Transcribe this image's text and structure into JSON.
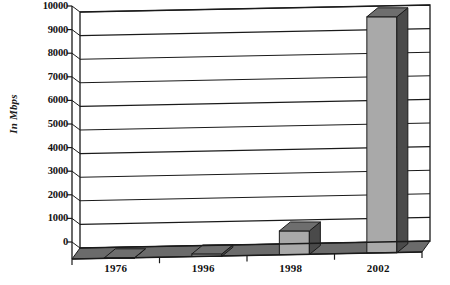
{
  "chart_data": {
    "type": "bar",
    "title": "",
    "subtitle": "",
    "xlabel": "",
    "ylabel": "In Mbps",
    "categories": [
      "1976",
      "1996",
      "1998",
      "2002"
    ],
    "values": [
      10,
      100,
      1000,
      10000
    ],
    "series": [
      {
        "name": "Speed",
        "values": [
          10,
          100,
          1000,
          10000
        ]
      }
    ],
    "ylim": [
      0,
      10000
    ],
    "ytick_labels": [
      "10000",
      "9000",
      "8000",
      "7000",
      "6000",
      "5000",
      "4000",
      "3000",
      "2000",
      "1000",
      "0"
    ],
    "ytick_values": [
      10000,
      9000,
      8000,
      7000,
      6000,
      5000,
      4000,
      3000,
      2000,
      1000,
      0
    ],
    "grid": true,
    "legend": "none",
    "style_3d": true,
    "colors": {
      "bar_front": "#a9a9a9",
      "bar_side": "#4a4a4a",
      "bar_top": "#6e6e6e",
      "floor": "#6b6b6b",
      "axis": "#1a1a1a",
      "grid": "#1a1a1a",
      "background": "#ffffff"
    }
  }
}
